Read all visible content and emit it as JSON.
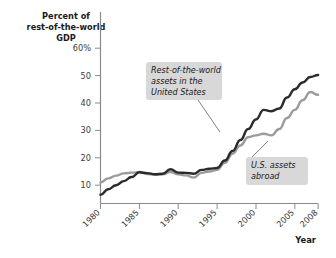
{
  "chart_data": {
    "type": "line",
    "title": "",
    "ylabel": "Percent of rest-of-the-world GDP",
    "xlabel": "Year",
    "ylabel_lines": [
      "Percent of",
      "rest-of-the-world",
      "GDP"
    ],
    "ylim": [
      0,
      62
    ],
    "xlim": [
      1980,
      2008
    ],
    "grid": false,
    "legend_position": "annotations",
    "ytick_labels": [
      "10",
      "20",
      "30",
      "40",
      "50",
      "60%"
    ],
    "ytick_values": [
      10,
      20,
      30,
      40,
      50,
      60
    ],
    "xtick_labels": [
      "1980",
      "1985",
      "1990",
      "1995",
      "2000",
      "2005",
      "2008"
    ],
    "xtick_values": [
      1980,
      1985,
      1990,
      1995,
      2000,
      2005,
      2008
    ],
    "x": [
      1980,
      1981,
      1982,
      1983,
      1984,
      1985,
      1986,
      1987,
      1988,
      1989,
      1990,
      1991,
      1992,
      1993,
      1994,
      1995,
      1996,
      1997,
      1998,
      1999,
      2000,
      2001,
      2002,
      2003,
      2004,
      2005,
      2006,
      2007,
      2008
    ],
    "series": [
      {
        "name": "Rest-of-the-world assets in the United States",
        "color": "#2b2b2b",
        "values": [
          6.5,
          8.5,
          10.0,
          11.5,
          13.0,
          14.7,
          14.4,
          14.0,
          14.2,
          15.8,
          14.6,
          14.5,
          14.2,
          15.6,
          16.0,
          16.3,
          19.0,
          22.5,
          26.5,
          30.5,
          34.0,
          37.5,
          37.0,
          38.0,
          42.0,
          45.0,
          47.5,
          49.5,
          50.2
        ]
      },
      {
        "name": "U.S. assets abroad",
        "color": "#9b9b9b",
        "values": [
          11.0,
          12.5,
          13.5,
          14.3,
          14.6,
          14.8,
          14.1,
          13.8,
          14.0,
          14.8,
          14.0,
          13.6,
          12.8,
          14.5,
          15.0,
          15.6,
          18.2,
          21.5,
          24.5,
          27.5,
          28.2,
          28.8,
          28.2,
          30.5,
          34.5,
          37.5,
          41.0,
          44.0,
          43.0
        ]
      }
    ],
    "annotations": [
      {
        "id": "rest-of-world-annotation",
        "lines": [
          "Rest-of-the-world",
          "assets in the",
          "United States"
        ],
        "text": "Rest-of-the-world assets in the United States"
      },
      {
        "id": "us-assets-annotation",
        "lines": [
          "U.S. assets",
          "abroad"
        ],
        "text": "U.S. assets abroad"
      }
    ],
    "colors": {
      "dark_series": "#2b2b2b",
      "gray_series": "#9b9b9b",
      "annotation_background": "#d8d8d8",
      "axis": "#8a8a8a",
      "background": "#ffffff"
    }
  }
}
